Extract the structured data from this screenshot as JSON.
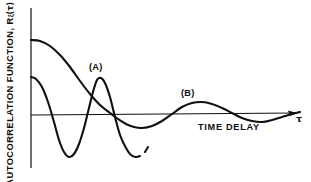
{
  "figure": {
    "background_color": "#ffffff",
    "ink_color": "#101010",
    "width": 311,
    "height": 182
  },
  "axes": {
    "y_axis_label_prefix": "AUTOCORRELATION FUNCTION, R",
    "y_axis_label_subscript": "ξ",
    "y_axis_label_suffix": "(τ)",
    "x_axis_label": "TIME DELAY",
    "x_axis_variable": "τ",
    "y_axis_x_px": 31,
    "zero_line_y_px": 115,
    "x_axis_arrow": true
  },
  "labels": {
    "curve_a": "(A)",
    "curve_b": "(B)"
  },
  "chart_data": {
    "type": "line",
    "title": "",
    "subtitle": "",
    "xlabel": "TIME DELAY",
    "ylabel": "AUTOCORRELATION FUNCTION, Rξ(τ)",
    "xlim": [
      0,
      1
    ],
    "ylim": [
      -1,
      1
    ],
    "grid": false,
    "legend": "inline annotations",
    "annotations": [
      {
        "text": "(A)",
        "x_px": 97,
        "y_px": 67,
        "describes": "fast damped oscillation, short correlation time"
      },
      {
        "text": "(B)",
        "x_px": 189,
        "y_px": 93,
        "describes": "slow damped oscillation, long correlation time"
      },
      {
        "text": "TIME DELAY",
        "x_px": 228,
        "y_px": 128,
        "describes": "x-axis label"
      },
      {
        "text": "τ",
        "x_px": 299,
        "y_px": 118,
        "describes": "x-axis variable at arrow tip"
      }
    ],
    "series": [
      {
        "name": "(A)",
        "note": "rapidly damped oscillatory autocorrelation; curve is truncated (broken off) before the plot right edge",
        "truncated": true,
        "points_px": [
          [
            31,
            77
          ],
          [
            36,
            79
          ],
          [
            42,
            87
          ],
          [
            48,
            102
          ],
          [
            54,
            122
          ],
          [
            59,
            140
          ],
          [
            64,
            152
          ],
          [
            69,
            157
          ],
          [
            74,
            154
          ],
          [
            79,
            144
          ],
          [
            84,
            128
          ],
          [
            89,
            108
          ],
          [
            93,
            92
          ],
          [
            97,
            80
          ],
          [
            101,
            78
          ],
          [
            105,
            83
          ],
          [
            110,
            97
          ],
          [
            115,
            117
          ],
          [
            120,
            135
          ],
          [
            126,
            148
          ],
          [
            131,
            155
          ],
          [
            136,
            157
          ],
          [
            140,
            156
          ]
        ],
        "break_gap_px": [
          [
            140,
            156
          ],
          [
            145,
            152
          ]
        ],
        "tail_points_px": [
          [
            145,
            152
          ],
          [
            148,
            147
          ]
        ]
      },
      {
        "name": "(B)",
        "note": "slowly damped oscillatory autocorrelation extending to the right edge",
        "truncated": false,
        "points_px": [
          [
            31,
            40
          ],
          [
            40,
            41
          ],
          [
            50,
            46
          ],
          [
            60,
            55
          ],
          [
            70,
            67
          ],
          [
            80,
            81
          ],
          [
            90,
            94
          ],
          [
            100,
            105
          ],
          [
            110,
            113
          ],
          [
            118,
            119
          ],
          [
            126,
            124
          ],
          [
            134,
            127
          ],
          [
            142,
            128
          ],
          [
            152,
            126
          ],
          [
            162,
            121
          ],
          [
            172,
            114
          ],
          [
            182,
            107
          ],
          [
            192,
            103
          ],
          [
            202,
            102
          ],
          [
            212,
            104
          ],
          [
            222,
            108
          ],
          [
            232,
            113
          ],
          [
            242,
            118
          ],
          [
            252,
            121
          ],
          [
            262,
            122
          ],
          [
            272,
            120
          ],
          [
            282,
            117
          ],
          [
            292,
            114
          ],
          [
            300,
            112
          ]
        ]
      }
    ]
  }
}
